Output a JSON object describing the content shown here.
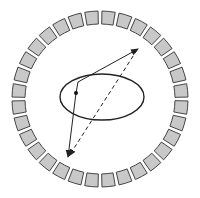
{
  "diagram": {
    "type": "geometric-schematic",
    "ring": {
      "center": [
        100,
        99
      ],
      "outer_radius": 88,
      "inner_radius": 75,
      "segment_count": 32,
      "segment_fill": "#c8c8c8",
      "segment_stroke": "#333333"
    },
    "ellipse": {
      "center": [
        102,
        97
      ],
      "rx": 42,
      "ry": 23,
      "stroke": "#222222"
    },
    "point": {
      "position": [
        76,
        93
      ],
      "color": "#111111"
    },
    "solid_path_up": {
      "points": [
        [
          76,
          93
        ],
        [
          78,
          82
        ],
        [
          138,
          49
        ]
      ],
      "stroke": "#222222"
    },
    "solid_path_down": {
      "points": [
        [
          76,
          93
        ],
        [
          68,
          157
        ]
      ],
      "stroke": "#222222"
    },
    "dashed_path": {
      "from": [
        137,
        50
      ],
      "to": [
        69,
        156
      ],
      "stroke": "#222222"
    }
  }
}
